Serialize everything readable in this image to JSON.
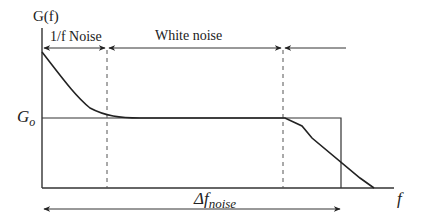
{
  "diagram": {
    "y_axis_label": "G(f)",
    "x_axis_label": "f",
    "level_label": "G",
    "level_subscript": "o",
    "regions": [
      {
        "label": "1/f Noise"
      },
      {
        "label": "White noise"
      }
    ],
    "bandwidth_label": "Δf",
    "bandwidth_subscript": "noise",
    "colors": {
      "stroke": "#222222",
      "background": "#ffffff"
    }
  }
}
